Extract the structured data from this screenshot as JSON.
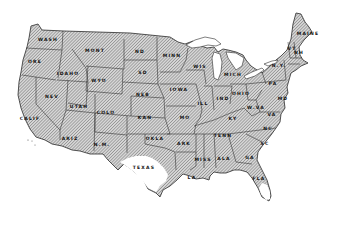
{
  "map": {
    "title": "",
    "colors": {
      "hatch_fill": "#cfcfcf",
      "hatch_line": "#6a6a6a",
      "border": "#2a2a2a",
      "unshaded": "#ffffff",
      "water": "#ffffff"
    },
    "states": [
      {
        "id": "wash",
        "label": "WASH",
        "x": 48,
        "y": 39
      },
      {
        "id": "ore",
        "label": "ORE",
        "x": 35,
        "y": 61
      },
      {
        "id": "calif",
        "label": "CALIF",
        "x": 30,
        "y": 118
      },
      {
        "id": "idaho",
        "label": "IDAHO",
        "x": 68,
        "y": 73
      },
      {
        "id": "nev",
        "label": "NEV",
        "x": 52,
        "y": 96
      },
      {
        "id": "mont",
        "label": "MONT",
        "x": 95,
        "y": 50
      },
      {
        "id": "wyo",
        "label": "WYO",
        "x": 99,
        "y": 80
      },
      {
        "id": "utah",
        "label": "UTAH",
        "x": 79,
        "y": 106
      },
      {
        "id": "colo",
        "label": "COLO",
        "x": 106,
        "y": 112
      },
      {
        "id": "ariz",
        "label": "ARIZ",
        "x": 70,
        "y": 138
      },
      {
        "id": "nm",
        "label": "N.M.",
        "x": 102,
        "y": 144
      },
      {
        "id": "nd",
        "label": "ND",
        "x": 140,
        "y": 51
      },
      {
        "id": "sd",
        "label": "SD",
        "x": 143,
        "y": 72
      },
      {
        "id": "neb",
        "label": "NEB",
        "x": 143,
        "y": 94
      },
      {
        "id": "kan",
        "label": "KAN",
        "x": 145,
        "y": 117
      },
      {
        "id": "okla",
        "label": "OKLA",
        "x": 155,
        "y": 138
      },
      {
        "id": "texas",
        "label": "TEXAS",
        "x": 144,
        "y": 167
      },
      {
        "id": "minn",
        "label": "MINN",
        "x": 172,
        "y": 55
      },
      {
        "id": "iowa",
        "label": "IOWA",
        "x": 179,
        "y": 89
      },
      {
        "id": "mo",
        "label": "MO",
        "x": 185,
        "y": 117
      },
      {
        "id": "ark",
        "label": "ARK",
        "x": 184,
        "y": 143
      },
      {
        "id": "la",
        "label": "LA",
        "x": 192,
        "y": 177
      },
      {
        "id": "wis",
        "label": "WIS",
        "x": 200,
        "y": 66
      },
      {
        "id": "ill",
        "label": "ILL",
        "x": 203,
        "y": 103
      },
      {
        "id": "mich",
        "label": "MICH",
        "x": 233,
        "y": 74
      },
      {
        "id": "ind",
        "label": "IND",
        "x": 223,
        "y": 98
      },
      {
        "id": "ohio",
        "label": "OHIO",
        "x": 241,
        "y": 93
      },
      {
        "id": "ky",
        "label": "KY",
        "x": 233,
        "y": 118
      },
      {
        "id": "tenn",
        "label": "TENN",
        "x": 223,
        "y": 135
      },
      {
        "id": "miss",
        "label": "MISS",
        "x": 203,
        "y": 159
      },
      {
        "id": "ala",
        "label": "ALA",
        "x": 224,
        "y": 158
      },
      {
        "id": "ga",
        "label": "GA",
        "x": 250,
        "y": 157
      },
      {
        "id": "fla",
        "label": "FLA",
        "x": 259,
        "y": 178
      },
      {
        "id": "sc",
        "label": "SC",
        "x": 265,
        "y": 143
      },
      {
        "id": "nc",
        "label": "NC",
        "x": 268,
        "y": 128
      },
      {
        "id": "va",
        "label": "VA",
        "x": 272,
        "y": 114
      },
      {
        "id": "wva",
        "label": "W.VA",
        "x": 256,
        "y": 107
      },
      {
        "id": "pa",
        "label": "PA",
        "x": 273,
        "y": 83
      },
      {
        "id": "ny",
        "label": "N.Y.",
        "x": 279,
        "y": 65
      },
      {
        "id": "maine",
        "label": "MAINE",
        "x": 308,
        "y": 33
      },
      {
        "id": "vt",
        "label": "VT",
        "x": 292,
        "y": 48
      },
      {
        "id": "nh",
        "label": "NH",
        "x": 299,
        "y": 52
      },
      {
        "id": "md",
        "label": "MD",
        "x": 283,
        "y": 98
      }
    ]
  }
}
